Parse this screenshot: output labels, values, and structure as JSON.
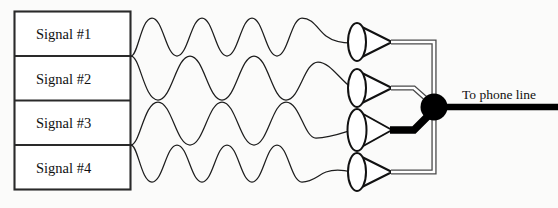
{
  "diagram": {
    "background_color": "#fbfbfa",
    "line_color": "#1d1d1d",
    "accent_color": "#000000"
  },
  "signal_boxes": {
    "label": "Signal source stack",
    "items": [
      {
        "label": "Signal #1",
        "wave_cycles": 3.5
      },
      {
        "label": "Signal #2",
        "wave_cycles": 2.5
      },
      {
        "label": "Signal #3",
        "wave_cycles": 2.5
      },
      {
        "label": "Signal #4",
        "wave_cycles": 3.5
      }
    ]
  },
  "cones": {
    "label": "Funnel couplers",
    "count": 4,
    "names": [
      "cone-1",
      "cone-2",
      "cone-3",
      "cone-4"
    ]
  },
  "wires": {
    "names": [
      "wire-1",
      "wire-2",
      "wire-3",
      "wire-4"
    ],
    "highlighted_index": 2,
    "highlight_color": "#000000",
    "normal_color": "#4a4a4a"
  },
  "junction": {
    "label": "combiner-node",
    "color": "#000000"
  },
  "output": {
    "label": "To phone line",
    "color": "#000000"
  }
}
